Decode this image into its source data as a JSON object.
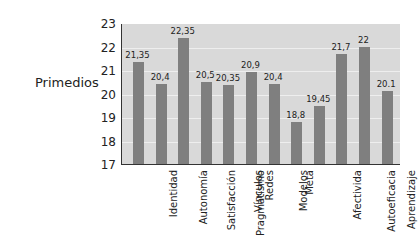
{
  "chart_data": {
    "type": "bar",
    "title": "",
    "xlabel": "",
    "ylabel": "Primedios",
    "ylim": [
      17,
      23
    ],
    "yticks": [
      "23",
      "22",
      "21",
      "20",
      "19",
      "18",
      "17"
    ],
    "grid": true,
    "legend": null,
    "categories": [
      "Identidad",
      "Autonomía",
      "Satisfacción",
      "Pragmatismo",
      "Vínculos",
      "Redes",
      "Modelos",
      "Meta",
      "Afectivida",
      "Autoeficacia",
      "Aprendizaje",
      "Generatividad"
    ],
    "values": [
      21.35,
      20.4,
      22.35,
      20.5,
      20.35,
      20.9,
      20.4,
      18.8,
      19.45,
      21.7,
      22,
      20.1
    ],
    "value_labels": [
      "21,35",
      "20,4",
      "22,35",
      "20,5",
      "20,35",
      "20,9",
      "20,4",
      "18,8",
      "19,45",
      "21,7",
      "22",
      "20.1"
    ],
    "colors": {
      "bar": "#7f7f7f",
      "plot_bg": "#d9d9d9",
      "grid": "#eeeeee",
      "axis": "#333333"
    }
  }
}
